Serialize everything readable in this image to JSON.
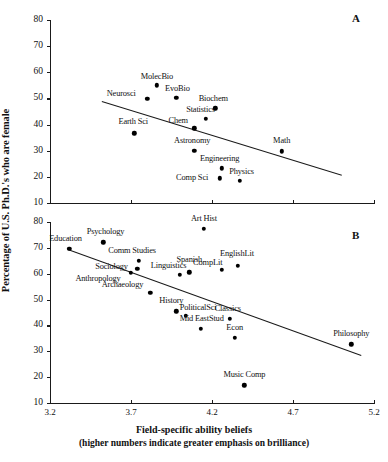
{
  "axes": {
    "ylabel": "Percentage of U.S. Ph.D.'s who are female",
    "xlabel_line1": "Field-specific ability beliefs",
    "xlabel_line2": "(higher numbers indicate greater emphasis on brilliance)",
    "xticks": [
      "3.2",
      "3.7",
      "4.2",
      "4.7",
      "5.2"
    ],
    "yticks_a": [
      "10",
      "20",
      "30",
      "40",
      "50",
      "60",
      "70",
      "80"
    ],
    "yticks_b": [
      "10",
      "20",
      "30",
      "40",
      "50",
      "60",
      "70",
      "80"
    ]
  },
  "panel_a_letter": "A",
  "panel_b_letter": "B",
  "chart_data": {
    "type": "scatter",
    "title": "",
    "xlabel": "Field-specific ability beliefs (higher numbers indicate greater emphasis on brilliance)",
    "ylabel": "Percentage of U.S. Ph.D.'s who are female",
    "xlim": [
      3.2,
      5.2
    ],
    "grid": false,
    "legend": null,
    "panels": [
      {
        "name": "A",
        "description": "STEM fields",
        "ylim": [
          10,
          80
        ],
        "trendline": {
          "x1": 3.52,
          "y1": 49.0,
          "x2": 5.0,
          "y2": 20.8
        },
        "points": [
          {
            "label": "MolecBio",
            "x": 3.86,
            "y": 55.0,
            "label_dx": 0,
            "label_dy": -9
          },
          {
            "label": "Neurosci",
            "x": 3.8,
            "y": 49.8,
            "label_dx": -26,
            "label_dy": -6
          },
          {
            "label": "EvoBio",
            "x": 3.98,
            "y": 50.3,
            "label_dx": 1,
            "label_dy": -10
          },
          {
            "label": "Biochem",
            "x": 4.22,
            "y": 46.2,
            "label_dx": -2,
            "label_dy": -10
          },
          {
            "label": "Statistics",
            "x": 4.16,
            "y": 42.1,
            "label_dx": -5,
            "label_dy": -10
          },
          {
            "label": "Chem",
            "x": 4.09,
            "y": 38.5,
            "label_dx": -16,
            "label_dy": -8
          },
          {
            "label": "Earth Sci",
            "x": 3.72,
            "y": 36.7,
            "label_dx": -1,
            "label_dy": -12
          },
          {
            "label": "Astronomy",
            "x": 4.09,
            "y": 30.0,
            "label_dx": -2,
            "label_dy": -11
          },
          {
            "label": "Math",
            "x": 4.63,
            "y": 29.7,
            "label_dx": 0,
            "label_dy": -11
          },
          {
            "label": "Engineering",
            "x": 4.26,
            "y": 23.2,
            "label_dx": -2,
            "label_dy": -10
          },
          {
            "label": "Comp Sci",
            "x": 4.25,
            "y": 19.4,
            "label_dx": -28,
            "label_dy": -1
          },
          {
            "label": "Physics",
            "x": 4.37,
            "y": 18.6,
            "label_dx": 2,
            "label_dy": -10
          }
        ]
      },
      {
        "name": "B",
        "description": "Social science and humanities fields",
        "ylim": [
          10,
          80
        ],
        "trendline": {
          "x1": 3.31,
          "y1": 69.5,
          "x2": 5.12,
          "y2": 28.5
        },
        "points": [
          {
            "label": "Education",
            "x": 3.32,
            "y": 69.6,
            "label_dx": -4,
            "label_dy": -11
          },
          {
            "label": "Psychology",
            "x": 3.53,
            "y": 72.2,
            "label_dx": 2,
            "label_dy": -11
          },
          {
            "label": "Art Hist",
            "x": 4.15,
            "y": 77.4,
            "label_dx": 0,
            "label_dy": -11
          },
          {
            "label": "Comm Studies",
            "x": 3.75,
            "y": 64.9,
            "label_dx": -7,
            "label_dy": -11
          },
          {
            "label": "Sociology",
            "x": 3.74,
            "y": 61.8,
            "label_dx": -26,
            "label_dy": -3
          },
          {
            "label": "Anthropology",
            "x": 3.7,
            "y": 60.3,
            "label_dx": -33,
            "label_dy": 5
          },
          {
            "label": "Archaeology",
            "x": 3.82,
            "y": 52.6,
            "label_dx": -28,
            "label_dy": -9
          },
          {
            "label": "Linguistics",
            "x": 4.0,
            "y": 59.5,
            "label_dx": -11,
            "label_dy": -10
          },
          {
            "label": "Spanish",
            "x": 4.06,
            "y": 60.5,
            "label_dx": 0,
            "label_dy": -13
          },
          {
            "label": "CompLit",
            "x": 4.26,
            "y": 61.5,
            "label_dx": -14,
            "label_dy": -8
          },
          {
            "label": "EnglishLit",
            "x": 4.36,
            "y": 63.1,
            "label_dx": -1,
            "label_dy": -13
          },
          {
            "label": "History",
            "x": 3.98,
            "y": 45.5,
            "label_dx": -5,
            "label_dy": -11
          },
          {
            "label": "PoliticalSci",
            "x": 4.04,
            "y": 43.7,
            "label_dx": 12,
            "label_dy": -9
          },
          {
            "label": "Mid EastStud",
            "x": 4.13,
            "y": 38.8,
            "label_dx": 1,
            "label_dy": -11
          },
          {
            "label": "Classics",
            "x": 4.31,
            "y": 42.5,
            "label_dx": -2,
            "label_dy": -11
          },
          {
            "label": "Econ",
            "x": 4.34,
            "y": 35.2,
            "label_dx": 0,
            "label_dy": -11
          },
          {
            "label": "Music Comp",
            "x": 4.4,
            "y": 16.8,
            "label_dx": 0,
            "label_dy": -11
          },
          {
            "label": "Philosophy",
            "x": 5.06,
            "y": 32.7,
            "label_dx": 0,
            "label_dy": -11
          }
        ]
      }
    ]
  }
}
